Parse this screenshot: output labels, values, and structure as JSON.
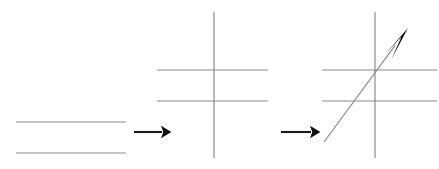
{
  "figure": {
    "title": "",
    "background_color": "#ffffff",
    "width": 439,
    "height": 169,
    "line_color": "#8a8a8a",
    "arrow_color": "#111111",
    "panels": [
      {
        "id": "panel-parallel-lines",
        "name": "two-parallel-horizontal-lines",
        "label": "",
        "elements": [
          {
            "name": "upper-horizontal-line",
            "type": "line",
            "x1": 16,
            "y1": 122,
            "x2": 126,
            "y2": 122
          },
          {
            "name": "lower-horizontal-line",
            "type": "line",
            "x1": 16,
            "y1": 153,
            "x2": 126,
            "y2": 153
          }
        ]
      },
      {
        "id": "panel-transversal-cross",
        "name": "vertical-transversal-crossing-two-lines",
        "label": "",
        "elements": [
          {
            "name": "vertical-transversal-line",
            "type": "line",
            "x1": 214,
            "y1": 12,
            "x2": 214,
            "y2": 158
          },
          {
            "name": "upper-horizontal-line",
            "type": "line",
            "x1": 157,
            "y1": 70,
            "x2": 268,
            "y2": 70
          },
          {
            "name": "lower-horizontal-line",
            "type": "line",
            "x1": 157,
            "y1": 101,
            "x2": 268,
            "y2": 101
          }
        ]
      },
      {
        "id": "panel-oblique-transversal",
        "name": "oblique-arrow-transversal-crossing-two-lines",
        "label": "",
        "elements": [
          {
            "name": "vertical-line",
            "type": "line",
            "x1": 375,
            "y1": 12,
            "x2": 375,
            "y2": 158
          },
          {
            "name": "upper-horizontal-line",
            "type": "line",
            "x1": 322,
            "y1": 70,
            "x2": 437,
            "y2": 70
          },
          {
            "name": "lower-horizontal-line",
            "type": "line",
            "x1": 322,
            "y1": 101,
            "x2": 437,
            "y2": 101
          },
          {
            "name": "oblique-arrow-line",
            "type": "arrow",
            "x1": 324,
            "y1": 142,
            "x2": 408,
            "y2": 28
          }
        ]
      }
    ],
    "connector_arrows": [
      {
        "name": "first-step-arrow",
        "x1": 134,
        "y1": 132,
        "x2": 168,
        "y2": 132
      },
      {
        "name": "second-step-arrow",
        "x1": 281,
        "y1": 132,
        "x2": 317,
        "y2": 132
      }
    ]
  },
  "chart_data": {
    "type": "diagram",
    "title": "",
    "stages": [
      {
        "index": 1,
        "name": "two parallel lines",
        "line_count": 2
      },
      {
        "index": 2,
        "name": "parallel lines cut by a vertical transversal",
        "line_count": 3
      },
      {
        "index": 3,
        "name": "parallel lines cut by an oblique directed transversal",
        "line_count": 4
      }
    ]
  }
}
